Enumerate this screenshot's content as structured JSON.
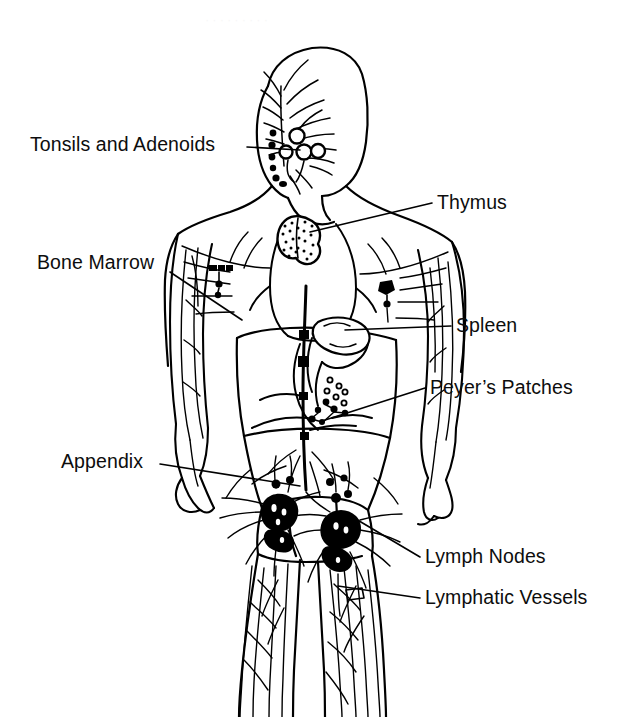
{
  "figure": {
    "view": "anterior full-body outline",
    "style": "black-and-white line drawing",
    "ink_color": "#000000",
    "background_color": "#ffffff",
    "scan_artifact_text": "·········"
  },
  "labels": [
    {
      "id": "tonsils",
      "text": "Tonsils and Adenoids",
      "side": "left",
      "x": 30,
      "y": 135,
      "leader": {
        "x1": 247,
        "y1": 147,
        "x2": 300,
        "y2": 150
      }
    },
    {
      "id": "thymus",
      "text": "Thymus",
      "side": "right",
      "x": 437,
      "y": 193,
      "leader": {
        "x1": 432,
        "y1": 203,
        "x2": 310,
        "y2": 232
      }
    },
    {
      "id": "marrow",
      "text": "Bone Marrow",
      "side": "left",
      "x": 37,
      "y": 253,
      "leader": {
        "x1": 170,
        "y1": 272,
        "x2": 242,
        "y2": 320
      }
    },
    {
      "id": "spleen",
      "text": "Spleen",
      "side": "right",
      "x": 456,
      "y": 316,
      "leader": {
        "x1": 451,
        "y1": 326,
        "x2": 345,
        "y2": 330
      }
    },
    {
      "id": "peyers",
      "text": "Peyer’s Patches",
      "side": "right",
      "x": 430,
      "y": 378,
      "leader": {
        "x1": 425,
        "y1": 388,
        "x2": 322,
        "y2": 421
      }
    },
    {
      "id": "appendix",
      "text": "Appendix",
      "side": "left",
      "x": 61,
      "y": 452,
      "leader": {
        "x1": 160,
        "y1": 464,
        "x2": 300,
        "y2": 486
      }
    },
    {
      "id": "nodes",
      "text": "Lymph Nodes",
      "side": "right",
      "x": 425,
      "y": 547,
      "leader": {
        "x1": 420,
        "y1": 557,
        "x2": 344,
        "y2": 512
      }
    },
    {
      "id": "vessels",
      "text": "Lymphatic Vessels",
      "side": "right",
      "x": 425,
      "y": 588,
      "leader": {
        "x1": 420,
        "y1": 598,
        "x2": 338,
        "y2": 586
      }
    }
  ],
  "structures": [
    {
      "name": "head-and-neck-vessels",
      "type": "vessel-network"
    },
    {
      "name": "tonsil-nodes",
      "type": "node-chain",
      "count": 9
    },
    {
      "name": "thymus-organ",
      "type": "stippled-organ"
    },
    {
      "name": "axillary-nodes",
      "type": "node-cluster",
      "count": 2
    },
    {
      "name": "spleen-organ",
      "type": "outlined-organ"
    },
    {
      "name": "peyers-patches",
      "type": "dotted-patches",
      "count": 12
    },
    {
      "name": "thoracic-duct",
      "type": "vertical-duct"
    },
    {
      "name": "inguinal-nodes",
      "type": "dense-node-cluster",
      "count": 2
    },
    {
      "name": "arm-vessels",
      "type": "vessel-network"
    },
    {
      "name": "leg-vessels",
      "type": "vessel-network"
    }
  ]
}
